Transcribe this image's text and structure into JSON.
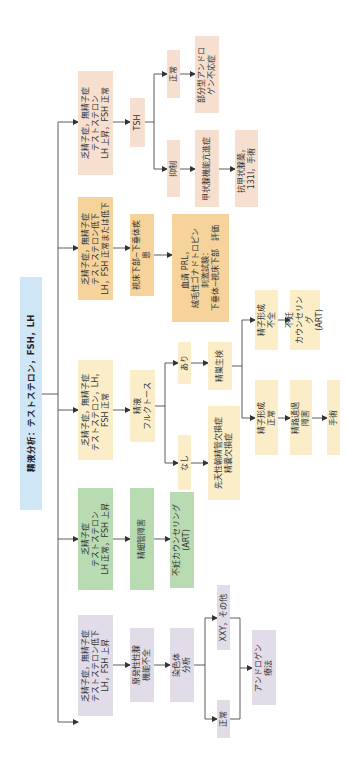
{
  "root": {
    "label": "精液分析：テストステロン，FSH，LH"
  },
  "branches": [
    {
      "id": "pink",
      "color": "#f7dfcf",
      "label": "乏精子症，無精子症\nテストステロン\nLH 上昇，FSH 正常",
      "tsh": "TSH",
      "normal": "正常",
      "normal_result": "部分型アンドロ\nゲン不応症",
      "suppressed": "抑制",
      "suppressed_result": "甲状腺機能亢進症",
      "treatment": "抗甲状腺薬，\n131I，手術"
    },
    {
      "id": "orange",
      "color": "#f5d39b",
      "label": "乏精子症，無精子症\nテストステロン低下\nLH，FSH 正常または低下",
      "step1": "視床下部−下垂体疾患",
      "step2": "血清 PRL，\n絨毛性ゴナドトロピン\n刺激試験：\n下垂体−視床下部　評価"
    },
    {
      "id": "yellow",
      "color": "#faedc8",
      "label": "乏精子症，無精子症\nテストステロン，LH，\nFSH 正常",
      "step1": "精液\nフルクトース",
      "present": "あり",
      "absent": "なし",
      "biopsy": "精巣生検",
      "absent_result": "先天性輸精管欠損症\n精嚢欠損症",
      "spermatogenesis_poor": "精子形成\n不全",
      "poor_result": "不妊\nカウンセリング\n(ART)",
      "spermatogenesis_normal": "精子形成\n正常",
      "obstruction": "精路通過\n障害",
      "surgery": "手術"
    },
    {
      "id": "green",
      "color": "#b9dbb2",
      "label": "乏精子症\nテストステロン\nLH 正常，FSH 上昇",
      "step1": "精細管障害",
      "step2": "不妊カウンセリング\n(ART)"
    },
    {
      "id": "lavender",
      "color": "#e2dbe8",
      "label": "乏精子症，無精子症\nテストステロン低下\nLH，FSH 上昇",
      "step1": "原発性性腺\n機能不全",
      "step2": "染色体\n分析",
      "abnormal": "XXY，その他",
      "normal": "正常",
      "treatment": "アンドロゲン\n療法"
    }
  ],
  "colors": {
    "root": "#cfe6f7",
    "line": "#333333"
  }
}
